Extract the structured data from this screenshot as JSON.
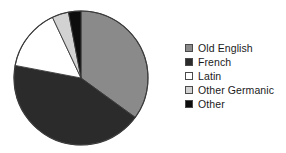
{
  "chart_data": {
    "type": "pie",
    "title": "",
    "subtitle": "",
    "xlabel": "",
    "ylabel": "",
    "grid": false,
    "legend_position": "right",
    "start_angle_deg": 0,
    "direction": "clockwise",
    "categories": [
      "Old English",
      "French",
      "Latin",
      "Other Germanic",
      "Other"
    ],
    "values": [
      35,
      43,
      15,
      4,
      3
    ],
    "units": "percent",
    "colors": [
      "#8a8a8a",
      "#2b2b2b",
      "#ffffff",
      "#d2d2d2",
      "#0d0d0d"
    ],
    "slices": [
      {
        "label": "Old English",
        "value": 35,
        "color": "#8a8a8a",
        "start_deg": 0,
        "end_deg": 126
      },
      {
        "label": "French",
        "value": 43,
        "color": "#2b2b2b",
        "start_deg": 126,
        "end_deg": 281
      },
      {
        "label": "Latin",
        "value": 15,
        "color": "#ffffff",
        "start_deg": 281,
        "end_deg": 335
      },
      {
        "label": "Other Germanic",
        "value": 4,
        "color": "#d2d2d2",
        "start_deg": 335,
        "end_deg": 350
      },
      {
        "label": "Other",
        "value": 3,
        "color": "#0d0d0d",
        "start_deg": 350,
        "end_deg": 360
      }
    ],
    "geometry": {
      "center_x": 81,
      "center_y": 78,
      "radius": 67,
      "outline_color": "#3b3b3b"
    }
  },
  "legend": {
    "items": [
      {
        "label": "Old English",
        "color": "#8a8a8a",
        "swatch": "legend-swatch-old-english"
      },
      {
        "label": "French",
        "color": "#2b2b2b",
        "swatch": "legend-swatch-french"
      },
      {
        "label": "Latin",
        "color": "#ffffff",
        "swatch": "legend-swatch-latin"
      },
      {
        "label": "Other Germanic",
        "color": "#d2d2d2",
        "swatch": "legend-swatch-other-germanic"
      },
      {
        "label": "Other",
        "color": "#0d0d0d",
        "swatch": "legend-swatch-other"
      }
    ]
  }
}
